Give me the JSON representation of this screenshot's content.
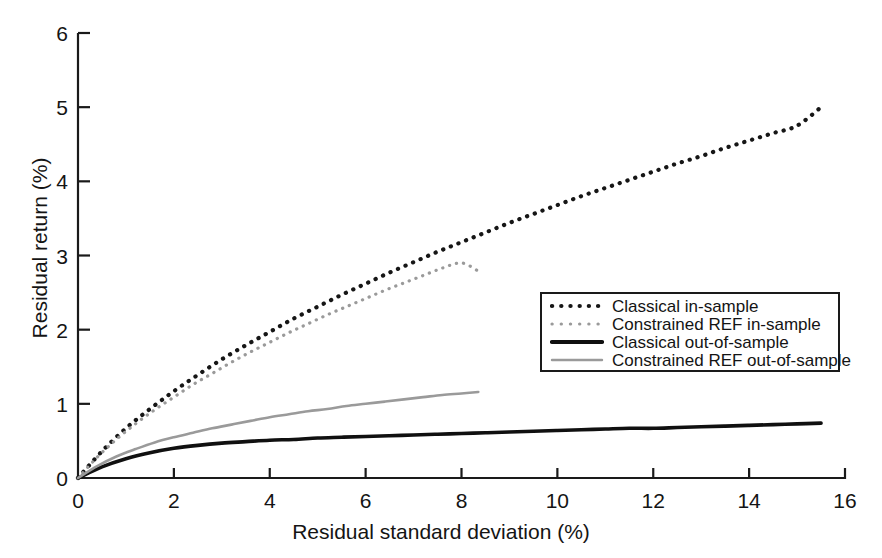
{
  "chart_data": {
    "type": "line",
    "title": "",
    "xlabel": "Residual standard deviation (%)",
    "ylabel": "Residual return (%)",
    "xlim": [
      0,
      16
    ],
    "ylim": [
      0,
      6
    ],
    "xticks": [
      "0",
      "2",
      "4",
      "6",
      "8",
      "10",
      "12",
      "14",
      "16"
    ],
    "yticks": [
      "0",
      "1",
      "2",
      "3",
      "4",
      "5",
      "6"
    ],
    "grid": false,
    "legend_position": "center-right",
    "series": [
      {
        "name": "Classical in-sample",
        "style": "dotted",
        "color": "#161616",
        "x": [
          0,
          0.5,
          1,
          1.5,
          2,
          2.5,
          3,
          3.5,
          4,
          4.5,
          5,
          5.5,
          6,
          6.5,
          7,
          7.5,
          8,
          8.5,
          9,
          9.5,
          10,
          10.5,
          11,
          11.5,
          12,
          12.5,
          13,
          13.5,
          14,
          14.5,
          15,
          15.5
        ],
        "y": [
          0,
          0.36,
          0.67,
          0.93,
          1.17,
          1.39,
          1.6,
          1.79,
          1.97,
          2.15,
          2.31,
          2.47,
          2.62,
          2.77,
          2.91,
          3.05,
          3.18,
          3.31,
          3.44,
          3.56,
          3.68,
          3.8,
          3.91,
          4.02,
          4.13,
          4.24,
          4.34,
          4.45,
          4.55,
          4.65,
          4.75,
          5.0
        ]
      },
      {
        "name": "Constrained REF in-sample",
        "style": "dotted",
        "color": "#9a9a9a",
        "x": [
          0,
          0.4,
          0.8,
          1.2,
          1.6,
          2,
          2.4,
          2.8,
          3.2,
          3.6,
          4,
          4.4,
          4.8,
          5.2,
          5.6,
          6,
          6.4,
          6.8,
          7.2,
          7.6,
          8,
          8.35
        ],
        "y": [
          0,
          0.28,
          0.52,
          0.73,
          0.92,
          1.09,
          1.26,
          1.41,
          1.56,
          1.7,
          1.83,
          1.96,
          2.08,
          2.2,
          2.31,
          2.42,
          2.53,
          2.63,
          2.73,
          2.83,
          2.9,
          2.79
        ]
      },
      {
        "name": "Classical out-of-sample",
        "style": "solid",
        "color": "#101010",
        "x": [
          0,
          0.5,
          1,
          1.5,
          2,
          2.5,
          3,
          3.5,
          4,
          4.5,
          5,
          5.5,
          6,
          6.5,
          7,
          7.5,
          8,
          8.5,
          9,
          9.5,
          10,
          10.5,
          11,
          11.5,
          12,
          12.5,
          13,
          13.5,
          14,
          14.5,
          15,
          15.5
        ],
        "y": [
          0,
          0.15,
          0.26,
          0.34,
          0.4,
          0.44,
          0.47,
          0.49,
          0.51,
          0.52,
          0.54,
          0.55,
          0.56,
          0.57,
          0.58,
          0.59,
          0.6,
          0.61,
          0.62,
          0.63,
          0.64,
          0.65,
          0.66,
          0.67,
          0.67,
          0.68,
          0.69,
          0.7,
          0.71,
          0.72,
          0.73,
          0.74
        ]
      },
      {
        "name": "Constrained REF out-of-sample",
        "style": "solid",
        "color": "#9a9a9a",
        "x": [
          0,
          0.4,
          0.8,
          1.2,
          1.6,
          2,
          2.4,
          2.8,
          3.2,
          3.6,
          4,
          4.4,
          4.8,
          5.2,
          5.6,
          6,
          6.4,
          6.8,
          7.2,
          7.6,
          8,
          8.35
        ],
        "y": [
          0,
          0.16,
          0.29,
          0.39,
          0.48,
          0.55,
          0.61,
          0.67,
          0.72,
          0.77,
          0.82,
          0.86,
          0.9,
          0.93,
          0.97,
          1.0,
          1.03,
          1.06,
          1.09,
          1.12,
          1.14,
          1.16
        ]
      }
    ]
  },
  "legend": {
    "items": [
      {
        "label": "Classical in-sample",
        "style": "dotted",
        "color": "#161616"
      },
      {
        "label": "Constrained REF in-sample",
        "style": "dotted",
        "color": "#9a9a9a"
      },
      {
        "label": "Classical out-of-sample",
        "style": "solid",
        "color": "#101010"
      },
      {
        "label": "Constrained REF out-of-sample",
        "style": "solid",
        "color": "#9a9a9a"
      }
    ]
  },
  "axes": {
    "x_title": "Residual standard deviation (%)",
    "y_title": "Residual return (%)",
    "axis_color": "#1a1a1a"
  }
}
